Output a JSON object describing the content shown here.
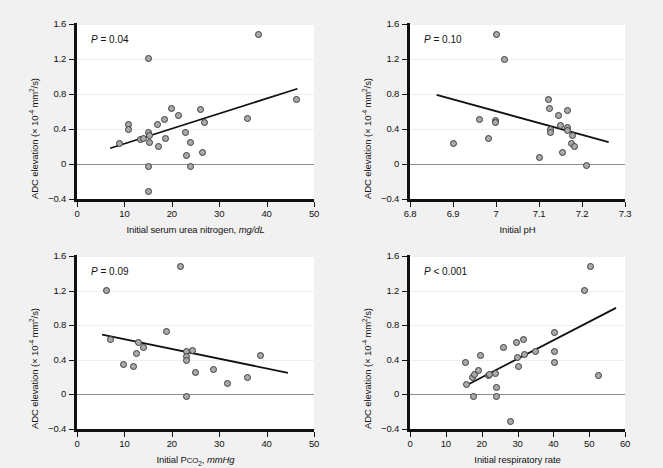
{
  "figure": {
    "background": "#f2f1f1",
    "panel_background": "#ffffff",
    "marker_fill": "#a9a9a9",
    "marker_stroke": "#3b3b3b",
    "line_color": "#111111",
    "zeroline_color": "#8d8d8d",
    "ylabel": "ADC elevation (× 10",
    "ylabel_exp": "-4",
    "ylabel_tail": " mm",
    "ylabel_exp2": "2",
    "ylabel_tail2": "/s)"
  },
  "chart_data": [
    {
      "id": "panel-a",
      "type": "scatter",
      "title": "",
      "annotation": "P = 0.04",
      "annotation_p": "P",
      "annotation_rest": " = 0.04",
      "xlabel_main": "Initial serum urea nitrogen, ",
      "xlabel_unit": "mg/dL",
      "ylabel": "ADC elevation (× 10-4 mm2/s)",
      "xlim": [
        0,
        50
      ],
      "ylim": [
        -0.4,
        1.6
      ],
      "xticks": [
        0,
        10,
        20,
        30,
        40,
        50
      ],
      "xticklabels": [
        "0",
        "10",
        "20",
        "30",
        "40",
        "50"
      ],
      "yticks": [
        -0.4,
        0,
        0.4,
        0.8,
        1.2,
        1.6
      ],
      "yticklabels": [
        "-0.4",
        "0",
        "0.4",
        "0.8",
        "1.2",
        "1.6"
      ],
      "grid": true,
      "zeroline": 0,
      "fit": {
        "x0": 7.0,
        "y0": 0.18,
        "x1": 46.5,
        "y1": 0.86
      },
      "points": [
        {
          "x": 9.0,
          "y": 0.23
        },
        {
          "x": 10.8,
          "y": 0.45
        },
        {
          "x": 10.8,
          "y": 0.39
        },
        {
          "x": 13.3,
          "y": 0.28
        },
        {
          "x": 14.0,
          "y": 0.29
        },
        {
          "x": 15.0,
          "y": 1.21
        },
        {
          "x": 15.0,
          "y": 0.36
        },
        {
          "x": 15.2,
          "y": 0.33
        },
        {
          "x": 15.2,
          "y": 0.25
        },
        {
          "x": 15.0,
          "y": -0.03
        },
        {
          "x": 15.0,
          "y": -0.31
        },
        {
          "x": 17.0,
          "y": 0.45
        },
        {
          "x": 17.2,
          "y": 0.2
        },
        {
          "x": 18.5,
          "y": 0.51
        },
        {
          "x": 18.6,
          "y": 0.29
        },
        {
          "x": 20.0,
          "y": 0.64
        },
        {
          "x": 21.5,
          "y": 0.55
        },
        {
          "x": 22.8,
          "y": 0.36
        },
        {
          "x": 23.0,
          "y": 0.1
        },
        {
          "x": 24.0,
          "y": 0.25
        },
        {
          "x": 24.0,
          "y": -0.03
        },
        {
          "x": 26.0,
          "y": 0.62
        },
        {
          "x": 26.5,
          "y": 0.13
        },
        {
          "x": 27.0,
          "y": 0.47
        },
        {
          "x": 36.0,
          "y": 0.52
        },
        {
          "x": 38.2,
          "y": 1.48
        },
        {
          "x": 46.3,
          "y": 0.74
        }
      ]
    },
    {
      "id": "panel-b",
      "type": "scatter",
      "annotation": "P = 0.10",
      "annotation_p": "P",
      "annotation_rest": " = 0.10",
      "xlabel_main": "Initial pH",
      "xlabel_unit": "",
      "ylabel": "ADC elevation (× 10-4 mm2/s)",
      "xlim": [
        6.8,
        7.3
      ],
      "ylim": [
        -0.4,
        1.6
      ],
      "xticks": [
        6.8,
        6.9,
        7.0,
        7.1,
        7.2,
        7.3
      ],
      "xticklabels": [
        "6.8",
        "6.9",
        "7",
        "7.1",
        "7.2",
        "7.3"
      ],
      "yticks": [
        -0.4,
        0,
        0.4,
        0.8,
        1.2,
        1.6
      ],
      "yticklabels": [
        "-0.4",
        "0",
        "0.4",
        "0.8",
        "1.2",
        "1.6"
      ],
      "grid": true,
      "zeroline": 0,
      "fit": {
        "x0": 6.862,
        "y0": 0.79,
        "x1": 7.262,
        "y1": 0.25
      },
      "points": [
        {
          "x": 6.9,
          "y": 0.23
        },
        {
          "x": 6.962,
          "y": 0.51
        },
        {
          "x": 6.982,
          "y": 0.29
        },
        {
          "x": 6.998,
          "y": 0.5
        },
        {
          "x": 6.998,
          "y": 0.47
        },
        {
          "x": 7.0,
          "y": 1.48
        },
        {
          "x": 7.02,
          "y": 1.2
        },
        {
          "x": 7.102,
          "y": 0.08
        },
        {
          "x": 7.122,
          "y": 0.74
        },
        {
          "x": 7.125,
          "y": 0.64
        },
        {
          "x": 7.126,
          "y": 0.4
        },
        {
          "x": 7.126,
          "y": 0.36
        },
        {
          "x": 7.146,
          "y": 0.55
        },
        {
          "x": 7.15,
          "y": 0.44
        },
        {
          "x": 7.155,
          "y": 0.13
        },
        {
          "x": 7.166,
          "y": 0.61
        },
        {
          "x": 7.166,
          "y": 0.42
        },
        {
          "x": 7.166,
          "y": 0.38
        },
        {
          "x": 7.176,
          "y": 0.23
        },
        {
          "x": 7.178,
          "y": 0.33
        },
        {
          "x": 7.182,
          "y": 0.2
        },
        {
          "x": 7.21,
          "y": -0.02
        }
      ]
    },
    {
      "id": "panel-c",
      "type": "scatter",
      "annotation": "P = 0.09",
      "annotation_p": "P",
      "annotation_rest": " = 0.09",
      "xlabel_main": "Initial P",
      "xlabel_sub_caps": "CO",
      "xlabel_sub_num": "2",
      "xlabel_comma": ", ",
      "xlabel_unit": "mmHg",
      "ylabel": "ADC elevation (× 10-4 mm2/s)",
      "xlim": [
        0,
        50
      ],
      "ylim": [
        -0.4,
        1.6
      ],
      "xticks": [
        0,
        10,
        20,
        30,
        40,
        50
      ],
      "xticklabels": [
        "0",
        "10",
        "20",
        "30",
        "40",
        "50"
      ],
      "yticks": [
        -0.4,
        0,
        0.4,
        0.8,
        1.2,
        1.6
      ],
      "yticklabels": [
        "-0.4",
        "0",
        "0.4",
        "0.8",
        "1.2",
        "1.6"
      ],
      "grid": true,
      "zeroline": 0,
      "fit": {
        "x0": 5.3,
        "y0": 0.69,
        "x1": 44.5,
        "y1": 0.25
      },
      "points": [
        {
          "x": 6.2,
          "y": 1.2
        },
        {
          "x": 7.0,
          "y": 0.64
        },
        {
          "x": 9.8,
          "y": 0.35
        },
        {
          "x": 11.9,
          "y": 0.32
        },
        {
          "x": 12.5,
          "y": 0.47
        },
        {
          "x": 13.0,
          "y": 0.6
        },
        {
          "x": 14.0,
          "y": 0.54
        },
        {
          "x": 18.8,
          "y": 0.73
        },
        {
          "x": 21.8,
          "y": 1.48
        },
        {
          "x": 23.0,
          "y": 0.5
        },
        {
          "x": 23.2,
          "y": 0.44
        },
        {
          "x": 23.2,
          "y": 0.39
        },
        {
          "x": 23.2,
          "y": -0.02
        },
        {
          "x": 24.3,
          "y": 0.51
        },
        {
          "x": 25.0,
          "y": 0.25
        },
        {
          "x": 28.8,
          "y": 0.29
        },
        {
          "x": 31.8,
          "y": 0.13
        },
        {
          "x": 36.0,
          "y": 0.2
        },
        {
          "x": 38.8,
          "y": 0.45
        }
      ]
    },
    {
      "id": "panel-d",
      "type": "scatter",
      "annotation": "P < 0.001",
      "annotation_p": "P",
      "annotation_rest": " < 0.001",
      "xlabel_main": "Initial respiratory rate",
      "xlabel_unit": "",
      "ylabel": "ADC elevation (× 10-4 mm2/s)",
      "xlim": [
        0,
        60
      ],
      "ylim": [
        -0.4,
        1.6
      ],
      "xticks": [
        0,
        10,
        20,
        30,
        40,
        50,
        60
      ],
      "xticklabels": [
        "0",
        "10",
        "20",
        "30",
        "40",
        "50",
        "60"
      ],
      "yticks": [
        -0.4,
        0,
        0.4,
        0.8,
        1.2,
        1.6
      ],
      "yticklabels": [
        "-0.4",
        "0",
        "0.4",
        "0.8",
        "1.2",
        "1.6"
      ],
      "grid": true,
      "zeroline": 0,
      "fit": {
        "x0": 15.5,
        "y0": 0.1,
        "x1": 57.5,
        "y1": 1.0
      },
      "points": [
        {
          "x": 15.6,
          "y": 0.37
        },
        {
          "x": 15.8,
          "y": 0.12
        },
        {
          "x": 17.5,
          "y": 0.19
        },
        {
          "x": 17.8,
          "y": -0.03
        },
        {
          "x": 18.0,
          "y": 0.23
        },
        {
          "x": 19.0,
          "y": 0.28
        },
        {
          "x": 19.8,
          "y": 0.45
        },
        {
          "x": 21.8,
          "y": 0.22
        },
        {
          "x": 22.2,
          "y": 0.23
        },
        {
          "x": 23.8,
          "y": 0.24
        },
        {
          "x": 24.0,
          "y": 0.08
        },
        {
          "x": 24.0,
          "y": -0.03
        },
        {
          "x": 26.0,
          "y": 0.54
        },
        {
          "x": 28.0,
          "y": -0.31
        },
        {
          "x": 29.8,
          "y": 0.6
        },
        {
          "x": 30.0,
          "y": 0.43
        },
        {
          "x": 30.2,
          "y": 0.32
        },
        {
          "x": 31.8,
          "y": 0.63
        },
        {
          "x": 32.0,
          "y": 0.46
        },
        {
          "x": 35.0,
          "y": 0.5
        },
        {
          "x": 40.2,
          "y": 0.72
        },
        {
          "x": 40.2,
          "y": 0.5
        },
        {
          "x": 40.2,
          "y": 0.37
        },
        {
          "x": 48.8,
          "y": 1.2
        },
        {
          "x": 50.5,
          "y": 1.48
        },
        {
          "x": 52.5,
          "y": 0.22
        }
      ]
    }
  ]
}
